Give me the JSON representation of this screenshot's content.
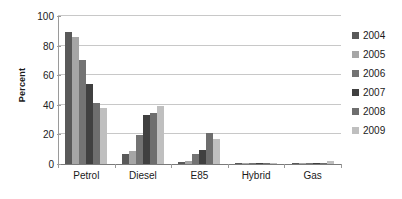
{
  "chart_data": {
    "type": "bar",
    "title": "",
    "subtitle": "",
    "xlabel": "",
    "ylabel": "Percent",
    "categories": [
      "Petrol",
      "Diesel",
      "E85",
      "Hybrid",
      "Gas"
    ],
    "series": [
      {
        "name": "2004",
        "color": "#595959",
        "values": [
          89,
          7,
          1.3,
          0.1,
          0.1
        ]
      },
      {
        "name": "2005",
        "color": "#a6a6a6",
        "values": [
          86,
          8.5,
          2,
          0.2,
          0.1
        ]
      },
      {
        "name": "2006",
        "color": "#737373",
        "values": [
          70,
          19.5,
          7,
          0.3,
          0.2
        ]
      },
      {
        "name": "2007",
        "color": "#404040",
        "values": [
          54,
          33,
          9.5,
          0.6,
          0.4
        ]
      },
      {
        "name": "2008",
        "color": "#6e6e6e",
        "values": [
          41,
          34.5,
          20.7,
          1.0,
          0.5
        ]
      },
      {
        "name": "2009",
        "color": "#bfbfbf",
        "values": [
          38,
          39.5,
          17,
          0.5,
          1.8
        ]
      }
    ],
    "ylim": [
      0,
      100
    ],
    "yticks": [
      0,
      20,
      40,
      60,
      80,
      100
    ],
    "ytick_labels": [
      "0",
      "20",
      "40",
      "60",
      "80",
      "100"
    ],
    "grid": true,
    "grid_axis": "y",
    "legend_position": "right",
    "legend_entries": [
      "2004",
      "2005",
      "2006",
      "2007",
      "2008",
      "2009"
    ]
  }
}
